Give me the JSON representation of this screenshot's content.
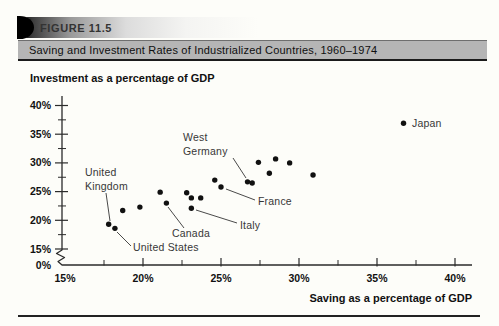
{
  "figure": {
    "label": "FIGURE 11.5",
    "title": "Saving and Investment Rates of Industrialized Countries, 1960–1974"
  },
  "chart_data": {
    "type": "scatter",
    "title": "Saving and Investment Rates of Industrialized Countries, 1960–1974",
    "xlabel": "Saving as a percentage of GDP",
    "ylabel": "Investment as a percentage of GDP",
    "xlim": [
      15,
      41
    ],
    "ylim": [
      15,
      41
    ],
    "x_ticks": [
      15,
      20,
      25,
      30,
      35,
      40
    ],
    "x_minor_ticks": [
      17.5,
      22.5,
      27.5,
      32.5,
      37.5
    ],
    "y_ticks": [
      15,
      20,
      25,
      30,
      35,
      40
    ],
    "y_minor_ticks": [
      17.5,
      22.5,
      27.5,
      32.5,
      37.5
    ],
    "tick_suffix": "%",
    "y_axis_break": true,
    "y_origin_label": "0%",
    "grid": false,
    "dot_color": "#111111",
    "points": [
      {
        "saving": 17.8,
        "investment": 19.3,
        "label": "United Kingdom"
      },
      {
        "saving": 18.2,
        "investment": 18.6,
        "label": "United States"
      },
      {
        "saving": 18.7,
        "investment": 21.7
      },
      {
        "saving": 19.8,
        "investment": 22.3
      },
      {
        "saving": 21.1,
        "investment": 24.9
      },
      {
        "saving": 21.5,
        "investment": 23.0,
        "label": "Canada"
      },
      {
        "saving": 22.8,
        "investment": 24.8
      },
      {
        "saving": 23.1,
        "investment": 23.9
      },
      {
        "saving": 23.7,
        "investment": 23.9
      },
      {
        "saving": 23.1,
        "investment": 22.1,
        "label": "Italy"
      },
      {
        "saving": 24.6,
        "investment": 27.0
      },
      {
        "saving": 25.0,
        "investment": 25.8,
        "label": "France"
      },
      {
        "saving": 26.7,
        "investment": 26.7,
        "label": "West Germany"
      },
      {
        "saving": 27.0,
        "investment": 26.5
      },
      {
        "saving": 27.4,
        "investment": 30.1
      },
      {
        "saving": 28.5,
        "investment": 30.7
      },
      {
        "saving": 29.4,
        "investment": 30.0
      },
      {
        "saving": 28.1,
        "investment": 28.2
      },
      {
        "saving": 30.9,
        "investment": 27.9
      },
      {
        "saving": 36.7,
        "investment": 36.9,
        "label": "Japan"
      }
    ],
    "label_layout": [
      {
        "text": "United Kingdom",
        "lines": [
          "United",
          "Kingdom"
        ],
        "x": 85,
        "y": 116,
        "leader": [
          106,
          133,
          110,
          161
        ]
      },
      {
        "text": "United States",
        "lines": [
          "United States"
        ],
        "x": 133,
        "y": 191,
        "leader": [
          131,
          186,
          117,
          172
        ]
      },
      {
        "text": "Canada",
        "lines": [
          "Canada"
        ],
        "x": 172,
        "y": 177,
        "leader": [
          184,
          168,
          168,
          147
        ]
      },
      {
        "text": "Italy",
        "lines": [
          "Italy"
        ],
        "x": 240,
        "y": 169,
        "leader": [
          237,
          163,
          196,
          150
        ]
      },
      {
        "text": "France",
        "lines": [
          "France"
        ],
        "x": 258,
        "y": 145,
        "leader": [
          255,
          140,
          226,
          129
        ]
      },
      {
        "text": "West Germany",
        "lines": [
          "West",
          "Germany"
        ],
        "x": 183,
        "y": 81,
        "leader": [
          233,
          98,
          246,
          118
        ]
      },
      {
        "text": "Japan",
        "lines": [
          "Japan"
        ],
        "x": 412,
        "y": 67,
        "leader": null
      }
    ]
  }
}
